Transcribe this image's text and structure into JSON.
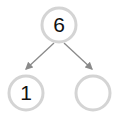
{
  "diagram": {
    "type": "number-bond",
    "whole": {
      "value": "6"
    },
    "parts": [
      {
        "value": "1"
      },
      {
        "value": ""
      }
    ],
    "colors": {
      "circle_stroke": "#d4d4d4",
      "circle_fill": "#ffffff",
      "arrow": "#8a8a8a",
      "text": "#111111"
    }
  }
}
